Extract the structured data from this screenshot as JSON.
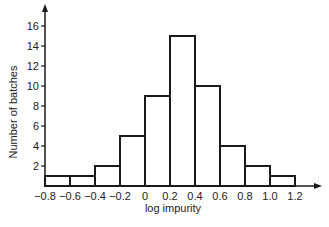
{
  "chart_data": {
    "type": "bar",
    "subtype": "histogram",
    "title": "",
    "xlabel": "log impurity",
    "ylabel": "Number of batches",
    "bin_edges": [
      -0.8,
      -0.6,
      -0.4,
      -0.2,
      0,
      0.2,
      0.4,
      0.6,
      0.8,
      1.0,
      1.2
    ],
    "categories": [
      "-0.8 to -0.6",
      "-0.6 to -0.4",
      "-0.4 to -0.2",
      "-0.2 to 0",
      "0 to 0.2",
      "0.2 to 0.4",
      "0.4 to 0.6",
      "0.6 to 0.8",
      "0.8 to 1.0",
      "1.0 to 1.2"
    ],
    "values": [
      1,
      1,
      2,
      5,
      9,
      15,
      10,
      4,
      2,
      1
    ],
    "x_tick_labels": [
      "−0.8",
      "−0.6",
      "−0.4",
      "−0.2",
      "0",
      "0.2",
      "0.4",
      "0.6",
      "0.8",
      "1.0",
      "1.2"
    ],
    "y_ticks": [
      2,
      4,
      6,
      8,
      10,
      12,
      14,
      16
    ],
    "y_tick_labels": [
      "2",
      "4",
      "6",
      "8",
      "10",
      "12",
      "14",
      "16"
    ],
    "xlim": [
      -0.8,
      1.2
    ],
    "ylim": [
      0,
      17
    ],
    "grid": false,
    "legend": null,
    "colors": {
      "stroke": "#1a1a1a",
      "fill": "#ffffff"
    }
  }
}
